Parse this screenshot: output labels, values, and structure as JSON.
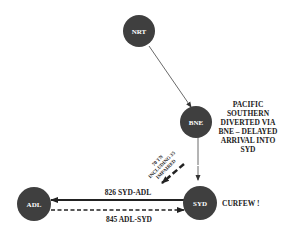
{
  "nodes": {
    "nrt": {
      "label": "NRT"
    },
    "bne": {
      "label": "BNE"
    },
    "syd": {
      "label": "SYD"
    },
    "adl": {
      "label": "ADL"
    }
  },
  "annotations": {
    "bne_note": [
      "PACIFIC",
      "SOUTHERN",
      "DIVERTED VIA",
      "BNE – DELAYED",
      "ARRIVAL INTO",
      "SYD"
    ],
    "syd_note": "CURFEW !",
    "transfer_note": [
      "70 TN",
      "INCLUDING 35",
      "IMPAIRED"
    ]
  },
  "edges": {
    "syd_adl": {
      "label": "826 SYD-ADL",
      "style": "solid"
    },
    "adl_syd": {
      "label": "845 ADL-SYD",
      "style": "dashed"
    },
    "nrt_bne": {
      "style": "solid-thin"
    },
    "bne_syd": {
      "style": "solid-thin"
    }
  },
  "colors": {
    "node": "#3f3f3f",
    "line": "#222222"
  }
}
